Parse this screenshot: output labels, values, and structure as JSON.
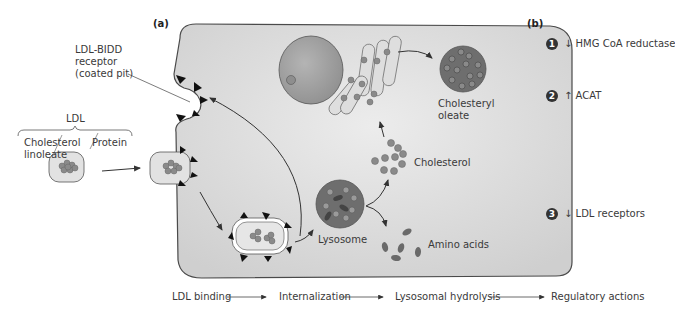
{
  "panel_a": {
    "label": "(a)",
    "receptor_label_line1": "LDL-BIDD",
    "receptor_label_line2": "receptor",
    "receptor_label_line3": "(coated pit)",
    "ldl_label": "LDL",
    "cholesterol_linoleate_line1": "Cholesterol",
    "cholesterol_linoleate_line2": "linoleate",
    "protein_label": "Protein",
    "lysosome_label": "Lysosome",
    "cholesterol_label": "Cholesterol",
    "amino_acids_label": "Amino acids",
    "cholesteryl_oleate_line1": "Cholesteryl",
    "cholesteryl_oleate_line2": "oleate"
  },
  "panel_b": {
    "label": "(b)",
    "actions": [
      {
        "number": "1",
        "arrow": "↓",
        "text": "HMG CoA reductase"
      },
      {
        "number": "2",
        "arrow": "↑",
        "text": "ACAT"
      },
      {
        "number": "3",
        "arrow": "↓",
        "text": "LDL receptors"
      }
    ]
  },
  "flow": {
    "steps": [
      "LDL binding",
      "Internalization",
      "Lysosomal hydrolysis",
      "Regulatory actions"
    ]
  },
  "colors": {
    "cell_fill": "#d4d4d4",
    "cell_stroke": "#555555",
    "particle_fill": "#8a8a8a",
    "receptor_fill": "#111111",
    "vesicle_fill": "#e6e6e6"
  }
}
